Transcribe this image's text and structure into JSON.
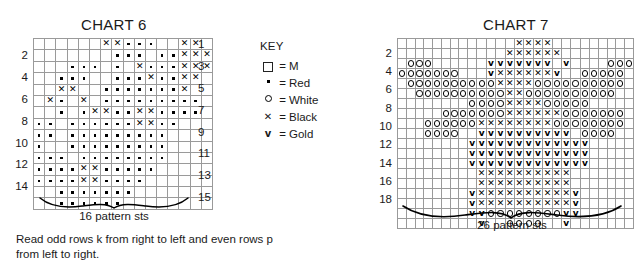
{
  "key": {
    "title": "KEY",
    "entries": [
      {
        "glyph": "square",
        "symbol": "□",
        "eq": "=",
        "name": "M"
      },
      {
        "glyph": "dot",
        "symbol": "•",
        "eq": "=",
        "name": "Red"
      },
      {
        "glyph": "circle",
        "symbol": "o",
        "eq": "=",
        "name": "White"
      },
      {
        "glyph": "x",
        "symbol": "×",
        "eq": "=",
        "name": "Black"
      },
      {
        "glyph": "v",
        "symbol": "v",
        "eq": "=",
        "name": "Gold"
      }
    ]
  },
  "instructions": {
    "text": "Read odd rows k from right to left and even rows p\nfrom left to right."
  },
  "chart_data": [
    {
      "type": "heatmap",
      "title": "CHART 6",
      "xlabel": "16 pattern sts",
      "ylabel": "",
      "columns": 16,
      "rows": 15,
      "left_row_labels": [
        "14",
        "12",
        "10",
        "8",
        "6",
        "4",
        "2"
      ],
      "right_row_labels": [
        "15",
        "13",
        "11",
        "9",
        "7",
        "5",
        "3",
        "1"
      ],
      "symbol_legend": {
        "M": " ",
        "Red": ".",
        "White": "o",
        "Black": "x",
        "Gold": "v"
      },
      "grid_top_to_bottom": [
        "      xx...  xx ",
        "       ... ..xxx",
        "   ... . x...xxx",
        "  ...  ...x..xx ",
        "  xx  .......x  ",
        " x. x .........  ",
        "  . .xx..xx....  ",
        ".. ......xx..   ",
        ".. .........   ",
        ".  .........   ",
        "... ........   ",
        "....xx.....    ",
        "....xx....     ",
        "  .......      ",
        "  ......       "
      ]
    },
    {
      "type": "heatmap",
      "title": "CHART 7",
      "xlabel": "26 pattern sts",
      "ylabel": "",
      "columns": 26,
      "rows": 19,
      "left_row_labels": [
        "18",
        "16",
        "14",
        "12",
        "10",
        "8",
        "6",
        "4",
        "2"
      ],
      "right_row_labels": [],
      "symbol_legend": {
        "M": " ",
        "Red": ".",
        "White": "o",
        "Black": "x",
        "Gold": "v"
      },
      "grid_top_to_bottom": [
        "             xxxx         ",
        "            xxxxxx        ",
        " ooo      vvvvvvv v    ooo",
        "ooooooo   vxxxxxxv  ooooo ",
        " ooooooooooxxxxoooooooooo ",
        "  ooooooooooxxoooooooooo  ",
        "        ooooxxxxooooo     ",
        "     oooooooxxxxxxooooooo ",
        "   ooooooxxxxxxxxoooooooo ",
        "   oooo  vvvvvvvvvv oooo  ",
        "        vvvvvvvvvvvvv     ",
        "        vvvvvvvvvvvvv     ",
        "        vvvvvvvvvvvvv     ",
        "         xxxxxxxxxx       ",
        "         xxxxxxxxxx       ",
        "        vxxxxxxxxxxv      ",
        "        vxxxxxxxxxxv      ",
        "        vvoooooooovv      ",
        "         v  oooo  v       "
      ]
    }
  ]
}
